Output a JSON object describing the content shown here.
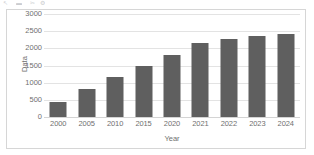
{
  "toolbar": {
    "icons": [
      {
        "name": "pointer-icon",
        "glyph": "↖"
      },
      {
        "name": "image-icon",
        "glyph": "▬"
      },
      {
        "name": "crop-icon",
        "glyph": "✂"
      },
      {
        "name": "settings-icon",
        "glyph": "⚙"
      }
    ]
  },
  "chart_data": {
    "type": "bar",
    "title": "",
    "xlabel": "Year",
    "ylabel": "Data",
    "categories": [
      "2000",
      "2005",
      "2010",
      "2015",
      "2020",
      "2021",
      "2022",
      "2023",
      "2024"
    ],
    "values": [
      450,
      820,
      1170,
      1480,
      1810,
      2150,
      2260,
      2350,
      2410
    ],
    "ylim": [
      0,
      3000
    ],
    "yticks": [
      0,
      500,
      1000,
      1500,
      2000,
      2500,
      3000
    ],
    "ytick_labels": [
      "0",
      "500",
      "1000",
      "1500",
      "2000",
      "2500",
      "3000"
    ],
    "grid": true,
    "legend": false,
    "legend_position": "none",
    "bar_color": "#5f5f5f",
    "gridline_color": "#e3e3e3",
    "axis_text_color": "#6f6f6f",
    "plot_background": "#ffffff",
    "border_color": "#d6d6d6"
  }
}
